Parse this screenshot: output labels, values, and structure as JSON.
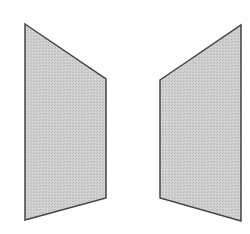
{
  "diagram": {
    "width": 250,
    "height": 234,
    "background": "#ffffff",
    "fill_color": "#cbcbcb",
    "stroke_color": "#444444",
    "stroke_width": 1.5,
    "shapes": [
      {
        "id": "left-panel",
        "type": "quadrilateral",
        "points": "25,24 106,79 106,198 25,220"
      },
      {
        "id": "right-panel",
        "type": "quadrilateral",
        "points": "160,80 241,25 241,221 160,198"
      }
    ]
  }
}
